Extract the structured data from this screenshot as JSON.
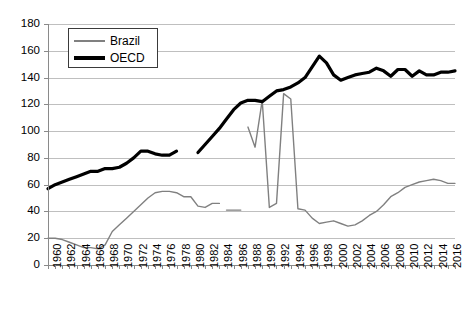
{
  "chart_data": {
    "type": "line",
    "title": "",
    "xlabel": "",
    "ylabel": "",
    "ylim": [
      0,
      180
    ],
    "ytick_step": 20,
    "yticks": [
      0,
      20,
      40,
      60,
      80,
      100,
      120,
      140,
      160,
      180
    ],
    "xlim": [
      1960,
      2017
    ],
    "xticks": [
      1960,
      1962,
      1964,
      1966,
      1968,
      1970,
      1972,
      1974,
      1976,
      1978,
      1980,
      1982,
      1984,
      1986,
      1988,
      1990,
      1992,
      1994,
      1996,
      1998,
      2000,
      2002,
      2004,
      2006,
      2008,
      2010,
      2012,
      2014,
      2016
    ],
    "xtick_labels": [
      "1960",
      "1962",
      "1964",
      "1966",
      "1968",
      "1970",
      "1972",
      "1974",
      "1976",
      "1978",
      "1980",
      "1982",
      "1984",
      "1986",
      "1988",
      "1990",
      "1992",
      "1994",
      "1996",
      "1998",
      "2000",
      "2002",
      "2004",
      "2006",
      "2008",
      "2010",
      "2012",
      "2014",
      "2016"
    ],
    "grid": "horizontal",
    "legend_position": "top-left",
    "series": [
      {
        "name": "Brazil",
        "color": "#808080",
        "line_width": 1.4,
        "segments": [
          {
            "x": [
              1960,
              1961,
              1962,
              1963,
              1964,
              1965,
              1966,
              1967,
              1968,
              1969,
              1970,
              1971,
              1972,
              1973,
              1974,
              1975,
              1976,
              1977,
              1978,
              1979,
              1980,
              1981,
              1982,
              1983,
              1984
            ],
            "y": [
              20,
              20,
              19,
              17,
              15,
              13,
              13,
              12,
              15,
              25,
              30,
              35,
              40,
              45,
              50,
              54,
              55,
              55,
              54,
              51,
              51,
              44,
              43,
              46,
              46
            ]
          },
          {
            "x": [
              1985,
              1986,
              1987
            ],
            "y": [
              41,
              41,
              41
            ]
          },
          {
            "x": [
              1988,
              1989,
              1990,
              1991,
              1992,
              1993,
              1994,
              1995,
              1996,
              1997,
              1998,
              1999,
              2000,
              2001,
              2002,
              2003,
              2004,
              2005,
              2006,
              2007,
              2008,
              2009,
              2010,
              2011,
              2012,
              2013,
              2014,
              2015,
              2016,
              2017
            ],
            "y": [
              103,
              88,
              123,
              43,
              46,
              128,
              124,
              42,
              41,
              35,
              31,
              32,
              33,
              31,
              29,
              30,
              33,
              37,
              40,
              45,
              51,
              54,
              58,
              60,
              62,
              63,
              64,
              63,
              61,
              61
            ]
          }
        ]
      },
      {
        "name": "OECD",
        "color": "#000000",
        "line_width": 3.2,
        "segments": [
          {
            "x": [
              1960,
              1961,
              1962,
              1963,
              1964,
              1965,
              1966,
              1967,
              1968,
              1969,
              1970,
              1971,
              1972,
              1973,
              1974,
              1975,
              1976,
              1977,
              1978
            ],
            "y": [
              57,
              60,
              62,
              64,
              66,
              68,
              70,
              70,
              72,
              72,
              73,
              76,
              80,
              85,
              85,
              83,
              82,
              82,
              85
            ]
          },
          {
            "x": [
              1981,
              1982,
              1983,
              1984,
              1985,
              1986,
              1987,
              1988,
              1989,
              1990,
              1991,
              1992,
              1993,
              1994,
              1995,
              1996,
              1997,
              1998,
              1999,
              2000,
              2001,
              2002,
              2003,
              2004,
              2005,
              2006,
              2007,
              2008,
              2009,
              2010,
              2011,
              2012,
              2013,
              2014,
              2015,
              2016,
              2017
            ],
            "y": [
              84,
              90,
              96,
              102,
              109,
              116,
              121,
              123,
              123,
              122,
              126,
              130,
              131,
              133,
              136,
              140,
              148,
              156,
              151,
              142,
              138,
              140,
              142,
              143,
              144,
              147,
              145,
              141,
              146,
              146,
              141,
              145,
              142,
              142,
              144,
              144,
              145
            ]
          }
        ]
      }
    ]
  },
  "legend": {
    "items": [
      {
        "label": "Brazil",
        "style": "brazil"
      },
      {
        "label": "OECD",
        "style": "oecd"
      }
    ]
  }
}
